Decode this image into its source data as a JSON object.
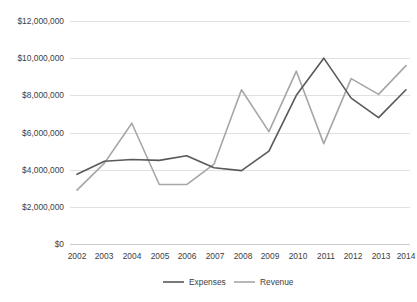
{
  "chart_data": {
    "type": "line",
    "title": "",
    "xlabel": "",
    "ylabel": "",
    "categories": [
      "2002",
      "2003",
      "2004",
      "2005",
      "2006",
      "2007",
      "2008",
      "2009",
      "2010",
      "2011",
      "2012",
      "2013",
      "2014"
    ],
    "series": [
      {
        "name": "Expenses",
        "color": "#595959",
        "values": [
          3750000,
          4450000,
          4550000,
          4500000,
          4750000,
          4100000,
          3950000,
          5000000,
          8000000,
          10000000,
          7850000,
          6800000,
          8300000
        ]
      },
      {
        "name": "Revenue",
        "color": "#a6a6a6",
        "values": [
          2900000,
          4350000,
          6500000,
          3200000,
          3200000,
          4300000,
          8300000,
          6050000,
          9300000,
          5400000,
          8900000,
          8050000,
          9600000
        ]
      }
    ],
    "ylim": [
      0,
      12000000
    ],
    "ytick_values": [
      0,
      2000000,
      4000000,
      6000000,
      8000000,
      10000000,
      12000000
    ],
    "ytick_labels": [
      "$0",
      "$2,000,000",
      "$4,000,000",
      "$6,000,000",
      "$8,000,000",
      "$10,000,000",
      "$12,000,000"
    ],
    "grid": true,
    "legend_position": "bottom",
    "legend_entries": [
      "Expenses",
      "Revenue"
    ]
  },
  "axes": {
    "y_labels": {
      "t6": "$12,000,000",
      "t5": "$10,000,000",
      "t4": "$8,000,000",
      "t3": "$6,000,000",
      "t2": "$4,000,000",
      "t1": "$2,000,000",
      "t0": "$0"
    },
    "x_labels": {
      "y0": "2002",
      "y1": "2003",
      "y2": "2004",
      "y3": "2005",
      "y4": "2006",
      "y5": "2007",
      "y6": "2008",
      "y7": "2009",
      "y8": "2010",
      "y9": "2011",
      "y10": "2012",
      "y11": "2013",
      "y12": "2014"
    }
  },
  "legend": {
    "expenses_label": "Expenses",
    "revenue_label": "Revenue"
  }
}
